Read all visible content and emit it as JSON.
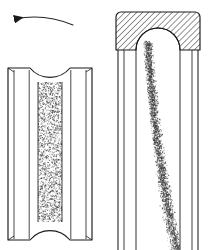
{
  "figure": {
    "background_color": "#ffffff",
    "line_color": "#1a1a1a",
    "stipple_color": "#3a3a3a",
    "hatch_color": "#2b2b2b",
    "width": 209,
    "height": 250
  },
  "annotations": {
    "rotation_arrow": {
      "name": "rotation-direction-arrow",
      "direction": "left",
      "label": "",
      "start_x": 73,
      "start_y": 24,
      "end_x": 13,
      "end_y": 19,
      "control_x": 43,
      "control_y": 14
    }
  },
  "left_object": {
    "name": "grooved-roller-front-view",
    "label": "",
    "bounds": {
      "x": 8,
      "y": 66,
      "width": 84,
      "height": 174
    },
    "flange_left": {
      "x1": 8,
      "x2": 30,
      "top_y": 68,
      "bottom_y": 240
    },
    "flange_right": {
      "x1": 70,
      "x2": 92,
      "top_y": 68,
      "bottom_y": 240
    },
    "groove_channel": {
      "x1": 38,
      "x2": 62,
      "top_y": 82,
      "bottom_y": 222
    },
    "top_arc": {
      "x1": 30,
      "x2": 70,
      "y": 68,
      "depth": 16,
      "shape": "concave"
    },
    "bottom_arc": {
      "x1": 30,
      "x2": 70,
      "y": 240,
      "depth": 16,
      "shape": "convex"
    },
    "fill_texture": "stipple",
    "stipple_density": "high",
    "stipple_seed": 17
  },
  "right_object": {
    "name": "hatched-housing-section-view",
    "label": "",
    "bounds": {
      "x": 116,
      "y": 12,
      "width": 84,
      "height": 238
    },
    "hatched_block": {
      "name": "cross-hatched-material",
      "x": 116,
      "y": 12,
      "width": 84,
      "height": 38,
      "corner_radius": 5,
      "hatch_angle_deg": 45,
      "hatch_spacing": 3
    },
    "dome_cutout": {
      "cx": 158,
      "cy": 50,
      "rx": 22,
      "ry": 22,
      "shape": "semicircle-up"
    },
    "wall_left": {
      "outer_x": 118,
      "inner_x": 124,
      "top_y": 50,
      "bottom_y": 250
    },
    "wall_right": {
      "inner_x": 192,
      "outer_x": 198,
      "top_y": 50,
      "bottom_y": 250
    },
    "bore_left_edge_x": 136,
    "bore_right_edge_x": 180,
    "particle_trail": {
      "name": "particle-flow-trail",
      "start_x": 148,
      "start_y": 42,
      "end_x": 172,
      "end_y": 250,
      "start_width": 12,
      "end_width": 17,
      "texture": "stipple",
      "stipple_seed": 43
    }
  }
}
